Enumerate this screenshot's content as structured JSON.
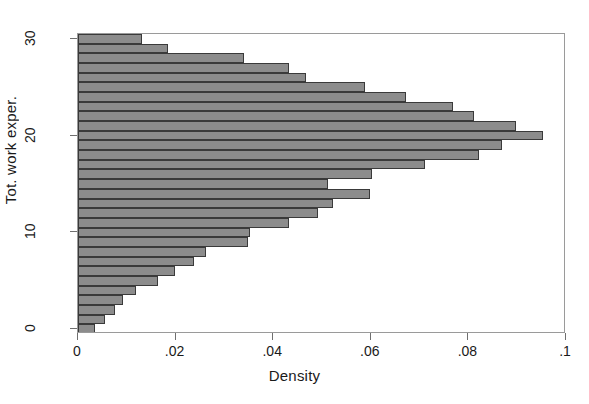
{
  "chart_data": {
    "type": "bar",
    "orientation": "horizontal",
    "title": "",
    "xlabel": "Density",
    "ylabel": "Tot. work exper.",
    "xlim": [
      0,
      0.1
    ],
    "ylim": [
      -0.5,
      30.5
    ],
    "grid": false,
    "legend": null,
    "bar_fill_color": "#8c8c8c",
    "bar_border_color": "#3a3a3a",
    "frame_color": "#9a9a9a",
    "xticks": [
      0,
      0.02,
      0.04,
      0.06,
      0.08,
      0.1
    ],
    "xtick_labels": [
      "0",
      ".02",
      ".04",
      ".06",
      ".08",
      ".1"
    ],
    "yticks": [
      0,
      10,
      20,
      30
    ],
    "ytick_labels": [
      "0",
      "10",
      "20",
      "30"
    ],
    "categories": [
      0,
      1,
      2,
      3,
      4,
      5,
      6,
      7,
      8,
      9,
      10,
      11,
      12,
      13,
      14,
      15,
      16,
      17,
      18,
      19,
      20,
      21,
      22,
      23,
      24,
      25,
      26,
      27,
      28,
      29,
      30
    ],
    "values": [
      0.0035,
      0.0055,
      0.0075,
      0.0092,
      0.0118,
      0.0163,
      0.0198,
      0.0238,
      0.0262,
      0.0348,
      0.0352,
      0.0432,
      0.0492,
      0.0522,
      0.0598,
      0.0512,
      0.0602,
      0.0712,
      0.0822,
      0.0868,
      0.0952,
      0.0898,
      0.0812,
      0.0768,
      0.0672,
      0.0588,
      0.0468,
      0.0432,
      0.034,
      0.0185,
      0.0132
    ],
    "bar_values_by_y": [
      {
        "y": 0,
        "density": 0.0035
      },
      {
        "y": 1,
        "density": 0.0055
      },
      {
        "y": 2,
        "density": 0.0075
      },
      {
        "y": 3,
        "density": 0.0092
      },
      {
        "y": 4,
        "density": 0.0118
      },
      {
        "y": 5,
        "density": 0.0163
      },
      {
        "y": 6,
        "density": 0.0198
      },
      {
        "y": 7,
        "density": 0.0238
      },
      {
        "y": 8,
        "density": 0.0262
      },
      {
        "y": 9,
        "density": 0.0348
      },
      {
        "y": 10,
        "density": 0.0352
      },
      {
        "y": 11,
        "density": 0.0432
      },
      {
        "y": 12,
        "density": 0.0492
      },
      {
        "y": 13,
        "density": 0.0522
      },
      {
        "y": 14,
        "density": 0.0598
      },
      {
        "y": 15,
        "density": 0.0512
      },
      {
        "y": 16,
        "density": 0.0602
      },
      {
        "y": 17,
        "density": 0.0712
      },
      {
        "y": 18,
        "density": 0.0822
      },
      {
        "y": 19,
        "density": 0.0868
      },
      {
        "y": 20,
        "density": 0.0952
      },
      {
        "y": 21,
        "density": 0.0898
      },
      {
        "y": 22,
        "density": 0.0812
      },
      {
        "y": 23,
        "density": 0.0768
      },
      {
        "y": 24,
        "density": 0.0672
      },
      {
        "y": 25,
        "density": 0.0588
      },
      {
        "y": 26,
        "density": 0.0468
      },
      {
        "y": 27,
        "density": 0.0432
      },
      {
        "y": 28,
        "density": 0.034
      },
      {
        "y": 29,
        "density": 0.0185
      },
      {
        "y": 30,
        "density": 0.0132
      }
    ]
  }
}
